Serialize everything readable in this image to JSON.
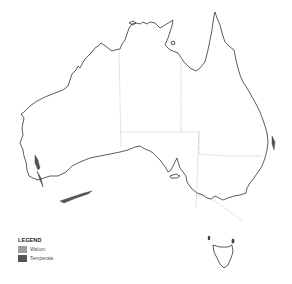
{
  "map": {
    "subject": "Australia",
    "legend": {
      "title": "LEGEND",
      "items": [
        {
          "label": "Walum",
          "color": "#9e9e9e"
        },
        {
          "label": "Temperate",
          "color": "#555555"
        }
      ]
    },
    "colors": {
      "coastline": "#333333",
      "state_borders": "#9a9a9a",
      "background": "#ffffff"
    }
  }
}
